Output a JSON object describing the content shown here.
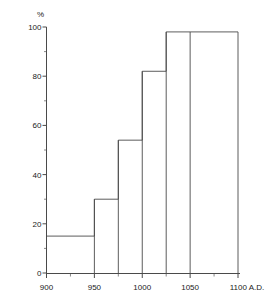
{
  "chart_data": {
    "type": "bar",
    "title": "",
    "subtitle": "",
    "xlabel": "",
    "ylabel": "%",
    "unit_label": "%",
    "axis_end_label": "A.D.",
    "xlim": [
      900,
      1100
    ],
    "ylim": [
      0,
      100
    ],
    "grid": false,
    "legend": "none",
    "x_ticks_major": [
      900,
      950,
      1000,
      1050,
      1100
    ],
    "x_ticks_major_labels": [
      "900",
      "950",
      "1000",
      "1050",
      "1100 A.D."
    ],
    "x_ticks_minor": [
      925,
      975,
      1025,
      1075
    ],
    "y_ticks_major": [
      0,
      20,
      40,
      60,
      80,
      100
    ],
    "y_ticks_major_labels": [
      "0",
      "20",
      "40",
      "60",
      "80",
      "100"
    ],
    "y_ticks_minor": [
      10,
      30,
      50,
      70,
      90
    ],
    "bins": [
      {
        "x0": 900,
        "x1": 950,
        "value": 15
      },
      {
        "x0": 950,
        "x1": 975,
        "value": 30
      },
      {
        "x0": 975,
        "x1": 1000,
        "value": 54
      },
      {
        "x0": 1000,
        "x1": 1025,
        "value": 82
      },
      {
        "x0": 1025,
        "x1": 1050,
        "value": 98
      },
      {
        "x0": 1050,
        "x1": 1100,
        "value": 98
      }
    ],
    "categories": [
      "900-950",
      "950-975",
      "975-1000",
      "1000-1025",
      "1025-1050",
      "1050-1100"
    ],
    "values": [
      15,
      30,
      54,
      82,
      98,
      98
    ]
  }
}
